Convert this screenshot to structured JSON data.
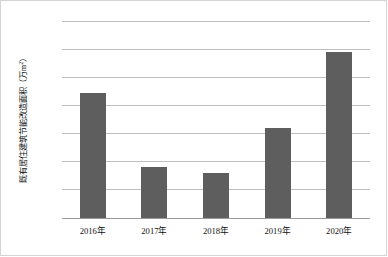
{
  "chart_data": {
    "type": "bar",
    "title": "",
    "subtitle": "",
    "xlabel": "",
    "ylabel": "既有居住建筑节能改造面积（万m²）",
    "ylabel_main": "既有居住建筑节能改造面积（万m",
    "ylabel_sup": "2",
    "ylabel_tail": "）",
    "categories": [
      "2016年",
      "2017年",
      "2018年",
      "2019年",
      "2020年"
    ],
    "values": [
      8900,
      3650,
      3200,
      6400,
      11800
    ],
    "ylim": [
      0,
      14000
    ],
    "ytick_values": [
      0,
      2000,
      4000,
      6000,
      8000,
      10000,
      12000,
      14000
    ],
    "ytick_labels": [
      "0",
      "2000",
      "4000",
      "6000",
      "8000",
      "10000",
      "12000",
      "14000"
    ],
    "grid": "horizontal",
    "legend": "none",
    "bar_color": "#5e5e5e",
    "gridline_color": "#bfbfbf",
    "axis_color": "#9a9a9a",
    "frame_color": "#d4d4d4",
    "background_color": "#ffffff"
  }
}
